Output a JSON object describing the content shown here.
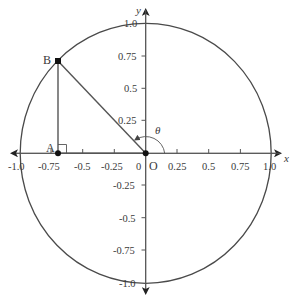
{
  "diagram": {
    "colors": {
      "stroke": "#4a4a4a",
      "axis": "#555555",
      "text": "#3a3a3a",
      "point": "#111111",
      "background": "#ffffff"
    },
    "axes": {
      "x_label": "x",
      "y_label": "y",
      "x_ticks": [
        "-1.0",
        "-0.75",
        "-0.5",
        "-0.25",
        "0.25",
        "0.5",
        "0.75",
        "1.0"
      ],
      "y_ticks": [
        "1.0",
        "0.75",
        "0.5",
        "0.25",
        "-0.25",
        "-0.5",
        "-0.75",
        "-1.0"
      ],
      "origin_tick": "0"
    },
    "points": {
      "origin": {
        "label": "O",
        "x": 0,
        "y": 0
      },
      "A": {
        "label": "A",
        "x": -0.7,
        "y": 0
      },
      "B": {
        "label": "B",
        "x": -0.7,
        "y": 0.71
      }
    },
    "angle": {
      "label": "θ",
      "description": "angle from positive x-axis to OB"
    },
    "circle": {
      "radius": 1.0
    }
  }
}
